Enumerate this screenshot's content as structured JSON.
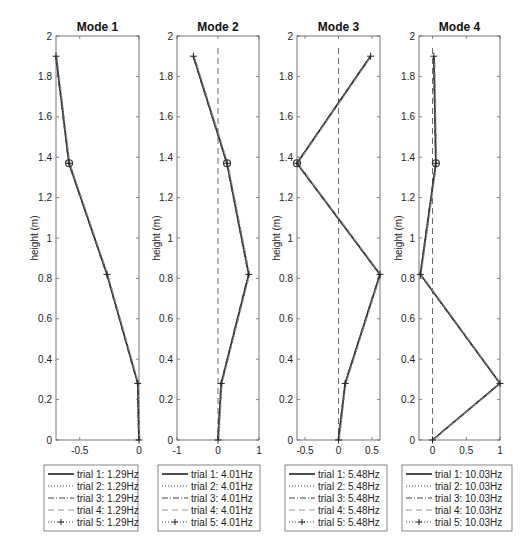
{
  "chart_data": [
    {
      "type": "line",
      "title": "Mode 1",
      "xlabel": "",
      "ylabel": "height (m)",
      "xlim": [
        -0.7,
        0
      ],
      "ylim": [
        0,
        2
      ],
      "xticks": [
        -0.5,
        0
      ],
      "xtick_labels": [
        "-0.5",
        "0"
      ],
      "yticks": [
        0,
        0.2,
        0.4,
        0.6,
        0.8,
        1,
        1.2,
        1.4,
        1.6,
        1.8,
        2
      ],
      "ytick_labels": [
        "0",
        "0.2",
        "0.4",
        "0.6",
        "0.8",
        "1",
        "1.2",
        "1.4",
        "1.6",
        "1.8",
        "2"
      ],
      "zero_line": false,
      "y": [
        0,
        0.28,
        0.82,
        1.37,
        1.9
      ],
      "x": [
        0,
        -0.01,
        -0.27,
        -0.59,
        -0.7
      ],
      "circle_marker_at_index": 3,
      "legend": [
        "trial 1: 1.29Hz",
        "trial 2: 1.29Hz",
        "trial 3: 1.29Hz",
        "trial 4: 1.29Hz",
        "trial 5: 1.29Hz"
      ],
      "grid": false,
      "legend_position": "below"
    },
    {
      "type": "line",
      "title": "Mode 2",
      "xlabel": "",
      "ylabel": "height (m)",
      "xlim": [
        -1,
        1
      ],
      "ylim": [
        0,
        2
      ],
      "xticks": [
        -1,
        0,
        1
      ],
      "xtick_labels": [
        "-1",
        "0",
        "1"
      ],
      "yticks": [
        0,
        0.2,
        0.4,
        0.6,
        0.8,
        1,
        1.2,
        1.4,
        1.6,
        1.8,
        2
      ],
      "ytick_labels": [
        "0",
        "0.2",
        "0.4",
        "0.6",
        "0.8",
        "1",
        "1.2",
        "1.4",
        "1.6",
        "1.8",
        "2"
      ],
      "zero_line": true,
      "y": [
        0,
        0.28,
        0.82,
        1.37,
        1.9
      ],
      "x": [
        0,
        0.08,
        0.75,
        0.22,
        -0.6
      ],
      "circle_marker_at_index": 3,
      "legend": [
        "trial 1: 4.01Hz",
        "trial 2: 4.01Hz",
        "trial 3: 4.01Hz",
        "trial 4: 4.01Hz",
        "trial 5: 4.01Hz"
      ],
      "grid": false,
      "legend_position": "below"
    },
    {
      "type": "line",
      "title": "Mode 3",
      "xlabel": "",
      "ylabel": "height (m)",
      "xlim": [
        -0.62,
        0.62
      ],
      "ylim": [
        0,
        2
      ],
      "xticks": [
        -0.5,
        0,
        0.5
      ],
      "xtick_labels": [
        "-0.5",
        "0",
        "0.5"
      ],
      "yticks": [
        0,
        0.2,
        0.4,
        0.6,
        0.8,
        1,
        1.2,
        1.4,
        1.6,
        1.8,
        2
      ],
      "ytick_labels": [
        "0",
        "0.2",
        "0.4",
        "0.6",
        "0.8",
        "1",
        "1.2",
        "1.4",
        "1.6",
        "1.8",
        "2"
      ],
      "zero_line": true,
      "y": [
        0,
        0.28,
        0.82,
        1.37,
        1.9
      ],
      "x": [
        0,
        0.1,
        0.62,
        -0.62,
        0.48
      ],
      "circle_marker_at_index": 3,
      "legend": [
        "trial 1: 5.48Hz",
        "trial 2: 5.48Hz",
        "trial 3: 5.48Hz",
        "trial 4: 5.48Hz",
        "trial 5: 5.48Hz"
      ],
      "grid": false,
      "legend_position": "below"
    },
    {
      "type": "line",
      "title": "Mode 4",
      "xlabel": "",
      "ylabel": "height (m)",
      "xlim": [
        -0.2,
        1
      ],
      "ylim": [
        0,
        2
      ],
      "xticks": [
        0,
        0.5,
        1
      ],
      "xtick_labels": [
        "0",
        "0.5",
        "1"
      ],
      "yticks": [
        0,
        0.2,
        0.4,
        0.6,
        0.8,
        1,
        1.2,
        1.4,
        1.6,
        1.8,
        2
      ],
      "ytick_labels": [
        "0",
        "0.2",
        "0.4",
        "0.6",
        "0.8",
        "1",
        "1.2",
        "1.4",
        "1.6",
        "1.8",
        "2"
      ],
      "zero_line": true,
      "y": [
        0,
        0.28,
        0.82,
        1.37,
        1.9
      ],
      "x": [
        0,
        1,
        -0.18,
        0.05,
        0.02
      ],
      "circle_marker_at_index": 3,
      "legend": [
        "trial 1: 10.03Hz",
        "trial 2: 10.03Hz",
        "trial 3: 10.03Hz",
        "trial 4: 10.03Hz",
        "trial 5: 10.03Hz"
      ],
      "grid": false,
      "legend_position": "below"
    }
  ],
  "layout": {
    "panels": [
      {
        "left": 56,
        "right": 139,
        "top": 36,
        "bottom": 440,
        "ylabel_x": 38,
        "legend_left": 44,
        "legend_width": 94
      },
      {
        "left": 177,
        "right": 259,
        "top": 36,
        "bottom": 440,
        "ylabel_x": 160,
        "legend_left": 158,
        "legend_width": 102
      },
      {
        "left": 297,
        "right": 380,
        "top": 36,
        "bottom": 440,
        "ylabel_x": 280,
        "legend_left": 285,
        "legend_width": 102
      },
      {
        "left": 419,
        "right": 500,
        "top": 36,
        "bottom": 440,
        "ylabel_x": 402,
        "legend_left": 402,
        "legend_width": 110
      }
    ],
    "legend_top": 465,
    "legend_row_height": 12
  },
  "colors": {
    "line": "#333333",
    "axes": "#555555",
    "zero_line": "#444444",
    "legend_border": "#666666"
  }
}
